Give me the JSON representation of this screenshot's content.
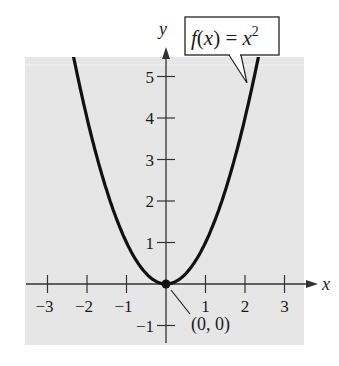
{
  "chart_data": {
    "type": "line",
    "title": "",
    "function_label": "f(x) = x²",
    "function_label_parts": {
      "f": "f",
      "open": "(",
      "x": "x",
      "close": ")",
      "eq": " = ",
      "base": "x",
      "exp": "2"
    },
    "xlabel": "x",
    "ylabel": "y",
    "xlim": [
      -3.5,
      3.5
    ],
    "ylim": [
      -1.5,
      5.5
    ],
    "grid": false,
    "legend": "none",
    "x_ticks": [
      -3,
      -2,
      -1,
      1,
      2,
      3
    ],
    "x_tick_labels": [
      "−3",
      "−2",
      "−1",
      "1",
      "2",
      "3"
    ],
    "y_ticks": [
      -1,
      1,
      2,
      3,
      4,
      5
    ],
    "y_tick_labels": [
      "−1",
      "1",
      "2",
      "3",
      "4",
      "5"
    ],
    "series": [
      {
        "name": "f(x) = x^2",
        "x": [
          -2.4,
          -2,
          -1.5,
          -1,
          -0.5,
          0,
          0.5,
          1,
          1.5,
          2,
          2.4
        ],
        "y": [
          5.76,
          4,
          2.25,
          1,
          0.25,
          0,
          0.25,
          1,
          2.25,
          4,
          5.76
        ]
      }
    ],
    "annotations": [
      {
        "type": "point",
        "x": 0,
        "y": 0,
        "label": "(0, 0)"
      },
      {
        "type": "callout",
        "text": "f(x) = x²",
        "points_to": [
          2.1,
          4.5
        ]
      }
    ]
  },
  "colors": {
    "plot_background": "#e6e6e6",
    "curve": "#111111",
    "axes": "#333333"
  }
}
